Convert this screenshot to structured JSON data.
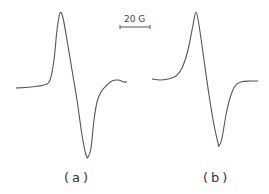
{
  "chart_data": {
    "type": "line",
    "title": "",
    "xlabel": "",
    "ylabel": "",
    "grid": false,
    "scale_bar": {
      "label": "20 G"
    },
    "panels": [
      {
        "label": "(a)",
        "description": "EPR derivative spectrum",
        "points": [
          [
            16,
            88
          ],
          [
            30,
            87
          ],
          [
            44,
            85
          ],
          [
            50,
            80
          ],
          [
            54,
            60
          ],
          [
            57,
            30
          ],
          [
            60,
            13
          ],
          [
            63,
            18
          ],
          [
            67,
            40
          ],
          [
            72,
            70
          ],
          [
            77,
            100
          ],
          [
            82,
            135
          ],
          [
            86,
            155
          ],
          [
            88,
            157
          ],
          [
            91,
            148
          ],
          [
            94,
            120
          ],
          [
            97,
            102
          ],
          [
            101,
            92
          ],
          [
            106,
            86
          ],
          [
            112,
            81
          ],
          [
            118,
            80
          ],
          [
            124,
            82
          ],
          [
            127,
            82
          ]
        ]
      },
      {
        "label": "(b)",
        "description": "EPR derivative spectrum",
        "points": [
          [
            152,
            79
          ],
          [
            160,
            80
          ],
          [
            168,
            79
          ],
          [
            176,
            76
          ],
          [
            182,
            68
          ],
          [
            188,
            50
          ],
          [
            193,
            25
          ],
          [
            196,
            12
          ],
          [
            199,
            25
          ],
          [
            204,
            60
          ],
          [
            209,
            95
          ],
          [
            214,
            125
          ],
          [
            218,
            143
          ],
          [
            219,
            146
          ],
          [
            222,
            138
          ],
          [
            226,
            115
          ],
          [
            230,
            98
          ],
          [
            235,
            86
          ],
          [
            241,
            82
          ],
          [
            250,
            81
          ],
          [
            258,
            81
          ]
        ]
      }
    ]
  },
  "labels": {
    "a": "(a)",
    "b": "(b)",
    "scale": "20 G"
  }
}
